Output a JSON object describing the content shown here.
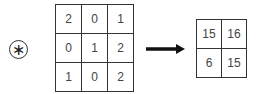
{
  "operator": {
    "symbol": "∗",
    "name": "convolution"
  },
  "input_matrix": [
    [
      "2",
      "0",
      "1"
    ],
    [
      "0",
      "1",
      "2"
    ],
    [
      "1",
      "0",
      "2"
    ]
  ],
  "output_matrix": [
    [
      "15",
      "16"
    ],
    [
      "6",
      "15"
    ]
  ],
  "arrow": {
    "icon": "right-arrow-icon"
  }
}
